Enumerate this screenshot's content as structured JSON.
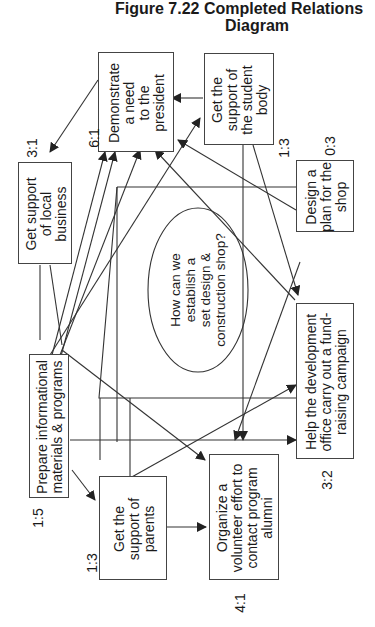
{
  "figure": {
    "title_line1": "Figure 7.22  Completed Relations",
    "title_line2": "Diagram"
  },
  "central_issue": {
    "text": "How can we\nestablish a\nset design &\nconstruction shop?"
  },
  "nodes": [
    {
      "id": "demonstrate",
      "text": "Demonstrate\na need\nto the\npresident",
      "ratio": "6:1"
    },
    {
      "id": "student-body",
      "text": "Get the\nsupport of\nthe student\nbody",
      "ratio": "1:3"
    },
    {
      "id": "local-business",
      "text": "Get support\nof local\nbusiness",
      "ratio": "3:1"
    },
    {
      "id": "design-plan",
      "text": "Design a\nplan for the\nshop",
      "ratio": "0:3"
    },
    {
      "id": "fundraising",
      "text": "Help the development\noffice carry out a fund-\nraising campaign",
      "ratio": "3:2"
    },
    {
      "id": "informational",
      "text": "Prepare informational\nmaterials & programs",
      "ratio": "1:5"
    },
    {
      "id": "parents",
      "text": "Get the\nsupport of\nparents",
      "ratio": "1:3"
    },
    {
      "id": "volunteer",
      "text": "Organize a\nvolunteer effort to\ncontact program\nalumni",
      "ratio": "4:1"
    }
  ],
  "colors": {
    "line": "#333333",
    "box_border": "#444444",
    "background": "#ffffff"
  }
}
